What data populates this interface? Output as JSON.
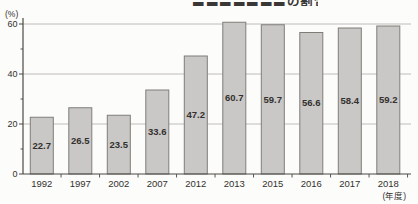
{
  "page": {
    "background_color": "#fcfcfa"
  },
  "chart_data": {
    "type": "bar",
    "title": "〓〓〓〓〓〓〓の割合",
    "title_cropped": true,
    "categories": [
      "1992",
      "1997",
      "2002",
      "2007",
      "2012",
      "2013",
      "2015",
      "2016",
      "2017",
      "2018"
    ],
    "values": [
      22.7,
      26.5,
      23.5,
      33.6,
      47.2,
      60.7,
      59.7,
      56.6,
      58.4,
      59.2
    ],
    "value_labels_shown": true,
    "ylabel": "(%)",
    "x_unit_label": "(年度)",
    "ylim": [
      0,
      60
    ],
    "yticks": [
      0,
      20,
      40,
      60
    ],
    "yticks_minor": [
      10,
      30,
      50
    ],
    "grid": true,
    "legend": "none",
    "colors": {
      "bar_fill": "#c9c8c6",
      "bar_border": "#807d79",
      "gridline": "#b9b7b3",
      "axis": "#4a4845",
      "label_text": "#33312e",
      "value_text": "#2e2c29"
    }
  }
}
